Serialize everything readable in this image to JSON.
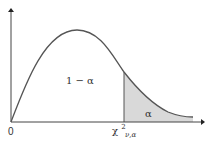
{
  "diagram": {
    "origin_label": "0",
    "body_label": "1 − α",
    "tail_label": "α",
    "critical_value": {
      "base": "χ",
      "superscript": "2",
      "subscript": "ν,α"
    },
    "colors": {
      "curve": "#555555",
      "axes": "#444444",
      "shade": "#d9d9d9",
      "text": "#333333"
    }
  }
}
